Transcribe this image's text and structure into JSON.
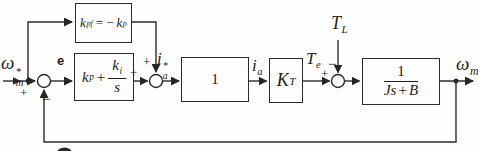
{
  "figure": {
    "bg": "#fefefe",
    "ink": "#2b2b2b",
    "labels": {
      "speed_ref": {
        "base": "ω",
        "sup": "*",
        "sub": "m"
      },
      "error": "e",
      "current_ref": {
        "base": "i",
        "sup": "*",
        "sub": "a"
      },
      "armature_current": {
        "base": "i",
        "sub": "a"
      },
      "electromagnetic_torque": {
        "base": "T",
        "sub": "e"
      },
      "load_torque": {
        "base": "T",
        "sub": "L"
      },
      "speed_out": {
        "base": "ω",
        "sub": "m"
      }
    },
    "signs": {
      "sum1_plus": "+",
      "sum1_minus": "−",
      "sum2_top_plus": "+",
      "sum2_left_plus": "+",
      "sum3_left_plus": "+",
      "sum3_top_minus": "−"
    },
    "blocks": {
      "feedforward": {
        "v1": "k",
        "v1_sub": "pf",
        "op": "= −",
        "v2": "k",
        "v2_sub": "p"
      },
      "pi": {
        "v1": "k",
        "v1_sub": "p",
        "op": "+",
        "num": "k",
        "num_sub": "i",
        "den": "s"
      },
      "unity": {
        "value": "1"
      },
      "torque_constant": {
        "v": "K",
        "v_sub": "T"
      },
      "plant": {
        "num": "1",
        "den_1": "Js",
        "den_op": "+",
        "den_2": "B"
      }
    }
  }
}
